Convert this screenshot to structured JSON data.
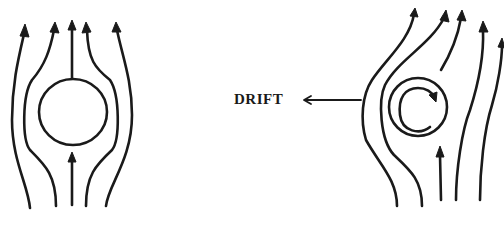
{
  "diagram": {
    "left_figure": {
      "name": "non-rotating cylinder in uniform flow",
      "streamlines": 5,
      "flow_direction": "upward"
    },
    "right_figure": {
      "name": "rotating cylinder in uniform flow",
      "streamlines": 6,
      "rotation": "clockwise",
      "flow_direction": "upward"
    },
    "annotation": {
      "label": "DRIFT",
      "arrow_direction": "left"
    },
    "colors": {
      "ink": "#1a1a1a",
      "background": "#ffffff"
    }
  }
}
